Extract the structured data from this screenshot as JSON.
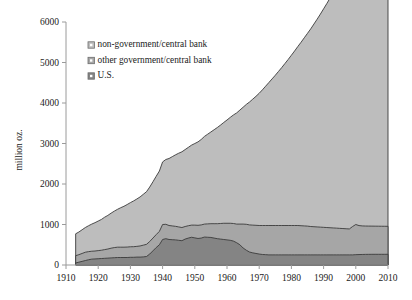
{
  "chart_data": {
    "type": "area",
    "stacked": true,
    "title": "",
    "subtitle": "",
    "xlabel": "",
    "ylabel": "million oz.",
    "xlim": [
      1910,
      2010
    ],
    "ylim": [
      0,
      6000
    ],
    "xticks": [
      1910,
      1920,
      1930,
      1940,
      1950,
      1960,
      1970,
      1980,
      1990,
      2000,
      2010
    ],
    "yticks": [
      0,
      1000,
      2000,
      3000,
      4000,
      5000,
      6000
    ],
    "grid": false,
    "legend_position": "top-left",
    "x": [
      1910,
      1911,
      1912,
      1913,
      1914,
      1915,
      1916,
      1917,
      1918,
      1919,
      1920,
      1921,
      1922,
      1923,
      1924,
      1925,
      1926,
      1927,
      1928,
      1929,
      1930,
      1931,
      1932,
      1933,
      1934,
      1935,
      1936,
      1937,
      1938,
      1939,
      1940,
      1941,
      1942,
      1943,
      1944,
      1945,
      1946,
      1947,
      1948,
      1949,
      1950,
      1951,
      1952,
      1953,
      1954,
      1955,
      1956,
      1957,
      1958,
      1959,
      1960,
      1961,
      1962,
      1963,
      1964,
      1965,
      1966,
      1967,
      1968,
      1969,
      1970,
      1971,
      1972,
      1973,
      1974,
      1975,
      1976,
      1977,
      1978,
      1979,
      1980,
      1981,
      1982,
      1983,
      1984,
      1985,
      1986,
      1987,
      1988,
      1989,
      1990,
      1991,
      1992,
      1993,
      1994,
      1995,
      1996,
      1997,
      1998,
      1999,
      2000,
      2001,
      2002,
      2003,
      2004,
      2005,
      2006,
      2007,
      2008,
      2009,
      2010
    ],
    "series": [
      {
        "name": "U.S.",
        "values": [
          0,
          0,
          0,
          50,
          70,
          90,
          110,
          130,
          145,
          150,
          155,
          160,
          165,
          170,
          175,
          180,
          185,
          185,
          185,
          185,
          190,
          190,
          195,
          195,
          200,
          210,
          270,
          350,
          430,
          500,
          630,
          650,
          630,
          625,
          620,
          610,
          600,
          640,
          665,
          685,
          670,
          655,
          665,
          690,
          685,
          680,
          665,
          650,
          640,
          630,
          620,
          610,
          590,
          550,
          500,
          420,
          365,
          320,
          300,
          285,
          270,
          260,
          255,
          250,
          250,
          250,
          250,
          250,
          250,
          250,
          250,
          250,
          250,
          250,
          250,
          250,
          250,
          250,
          250,
          250,
          250,
          250,
          250,
          250,
          250,
          250,
          250,
          250,
          250,
          250,
          255,
          258,
          260,
          262,
          263,
          264,
          264,
          264,
          264,
          264,
          265
        ]
      },
      {
        "name": "other government/central bank",
        "values": [
          0,
          0,
          0,
          180,
          185,
          195,
          205,
          200,
          195,
          195,
          200,
          205,
          215,
          225,
          240,
          250,
          255,
          255,
          255,
          258,
          260,
          262,
          265,
          275,
          290,
          300,
          310,
          315,
          320,
          330,
          370,
          355,
          345,
          340,
          335,
          330,
          325,
          310,
          305,
          300,
          315,
          325,
          325,
          320,
          330,
          340,
          355,
          370,
          385,
          400,
          410,
          420,
          435,
          460,
          510,
          590,
          640,
          670,
          685,
          695,
          705,
          715,
          720,
          725,
          725,
          725,
          725,
          725,
          725,
          725,
          725,
          725,
          725,
          720,
          715,
          710,
          700,
          695,
          690,
          685,
          680,
          675,
          670,
          665,
          660,
          655,
          650,
          645,
          640,
          700,
          745,
          715,
          705,
          700,
          698,
          696,
          695,
          694,
          693,
          692,
          690
        ]
      },
      {
        "name": "non-government/central bank",
        "values": [
          0,
          0,
          0,
          540,
          560,
          585,
          610,
          640,
          670,
          700,
          730,
          760,
          800,
          830,
          865,
          900,
          935,
          975,
          1010,
          1050,
          1090,
          1130,
          1170,
          1210,
          1255,
          1300,
          1345,
          1390,
          1440,
          1490,
          1545,
          1600,
          1655,
          1710,
          1765,
          1820,
          1870,
          1900,
          1935,
          1975,
          2015,
          2060,
          2110,
          2165,
          2215,
          2265,
          2320,
          2375,
          2430,
          2490,
          2550,
          2615,
          2680,
          2745,
          2815,
          2885,
          2960,
          3035,
          3110,
          3185,
          3265,
          3350,
          3440,
          3530,
          3620,
          3710,
          3805,
          3900,
          4000,
          4100,
          4205,
          4310,
          4420,
          4530,
          4645,
          4760,
          4880,
          5005,
          5130,
          5260,
          5395,
          5530,
          5670,
          5815,
          5965,
          6120,
          6280,
          6445,
          6615,
          6790,
          6970,
          7155,
          7345,
          7540,
          7740,
          7945,
          8155,
          8370,
          8590,
          8815,
          9045
        ]
      }
    ],
    "series_display": [
      {
        "name": "non-government/central bank",
        "color": "#bdbdbd"
      },
      {
        "name": "other government/central bank",
        "color": "#a6a6a6"
      },
      {
        "name": "U.S.",
        "color": "#848484"
      }
    ],
    "peak_total_2010": 9045,
    "axis_color": "#9a9a9a",
    "line_color": "#3b3b3b"
  },
  "legend": {
    "items": [
      {
        "label": "non-government/central bank"
      },
      {
        "label": "other government/central bank"
      },
      {
        "label": "U.S."
      }
    ]
  }
}
